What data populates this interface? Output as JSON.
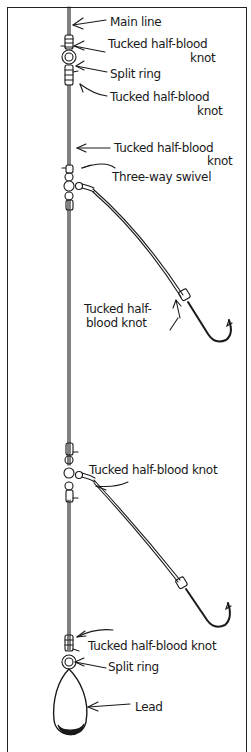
{
  "diagram": {
    "type": "fishing-rig",
    "colors": {
      "ink": "#1a1a1a",
      "background": "#ffffff"
    },
    "labels": {
      "main_line": "Main line",
      "knot1_a": "Tucked half-blood",
      "knot1_b": "knot",
      "split_ring_top": "Split ring",
      "knot2_a": "Tucked half-blood",
      "knot2_b": "knot",
      "knot3_a": "Tucked half-blood",
      "knot3_b": "knot",
      "three_way_swivel": "Three-way swivel",
      "hook1_knot_a": "Tucked half-",
      "hook1_knot_b": "blood knot",
      "swivel2_knot": "Tucked half-blood knot",
      "bottom_knot": "Tucked half-blood knot",
      "split_ring_bottom": "Split ring",
      "lead": "Lead"
    }
  }
}
